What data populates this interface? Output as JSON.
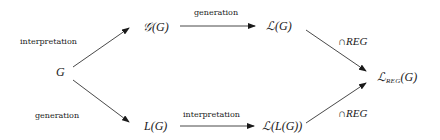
{
  "diagram": {
    "nodes": {
      "g": "G",
      "grammar_set": "𝒢(G)",
      "language_of_grammar": "ℒ(G)",
      "l_g": "L(G)",
      "language_of_l": "ℒ(L(G))",
      "reg_language_main": "ℒ",
      "reg_language_sub": "REG",
      "reg_language_arg": "(G)"
    },
    "edges": {
      "g_to_grammar_set": "interpretation",
      "grammar_set_to_language": "generation",
      "g_to_l_g": "generation",
      "l_g_to_language_of_l": "interpretation",
      "language_to_reg_symbol": "∩",
      "language_to_reg_text": "REG",
      "language_of_l_to_reg_symbol": "∩",
      "language_of_l_to_reg_text": "REG"
    }
  }
}
